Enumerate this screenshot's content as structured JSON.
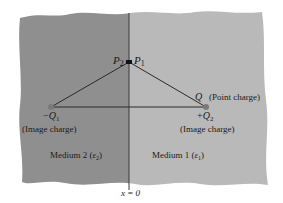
{
  "diagram": {
    "type": "method-of-images-dielectric-interface",
    "colors": {
      "medium2_fill": "#8f8f8f",
      "medium1_fill": "#b9b9b9",
      "line": "#2a2a2a",
      "charge_dot": "#7a7a7a",
      "text": "#1a1a1a"
    },
    "point_labels": {
      "p2": "P",
      "p2_sub": "2",
      "p1": "P",
      "p1_sub": "1"
    },
    "charges": {
      "image_left": {
        "sign": "−",
        "name": "Q",
        "sub": "1",
        "note": "(Image charge)"
      },
      "point_charge": {
        "name": "Q",
        "note": "(Point charge)"
      },
      "image_right": {
        "sign": "+",
        "name": "Q",
        "sub": "2",
        "note": "(Image charge)"
      }
    },
    "media": {
      "left": {
        "label": "Medium 2 (",
        "eps": "ε",
        "eps_sub": "2",
        "close": ")"
      },
      "right": {
        "label": "Medium 1 (",
        "eps": "ε",
        "eps_sub": "1",
        "close": ")"
      }
    },
    "boundary": {
      "label": "x = 0"
    }
  }
}
